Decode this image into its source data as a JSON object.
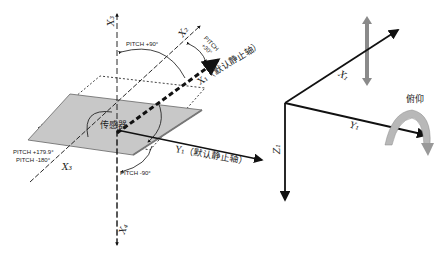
{
  "left_diagram": {
    "sensor_label": "传感器",
    "axis_up_label": "X₃",
    "axis_down_label": "X₄",
    "axis_x2_label": "X₂",
    "axis_x1_label": "X₁（默认静止轴）",
    "axis_y1_label": "Y₁（默认静止轴）",
    "axis_x3_label": "X₃",
    "pitch_plus90": "PITCH +90°",
    "pitch_plus30_line1": "PITCH",
    "pitch_plus30_line2": "+30°",
    "pitch_179": "PITCH +179.9°",
    "pitch_minus180": "PITCH -180°",
    "pitch_minus90": "PITCH -90°"
  },
  "right_diagram": {
    "axis_x_label": "X₁",
    "axis_y_label": "Y₁",
    "axis_z_label": "Z₁",
    "rotation_label": "俯仰"
  },
  "colors": {
    "plane_fill": "#c8c8c8",
    "line": "#111111",
    "gray_arrow": "#8a8a8a",
    "curved_arrow": "#b0b0b0"
  }
}
